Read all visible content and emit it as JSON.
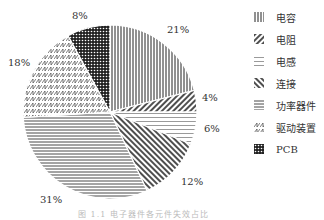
{
  "chart_data": {
    "type": "pie",
    "title": "",
    "start_angle": "12 o'clock, clockwise",
    "slices": [
      {
        "label": "电容",
        "value": 21,
        "pattern": "vertical-lines",
        "label_text": "21%"
      },
      {
        "label": "电阻",
        "value": 4,
        "pattern": "backslash-lines",
        "label_text": "4%"
      },
      {
        "label": "电感",
        "value": 6,
        "pattern": "waves",
        "label_text": "6%"
      },
      {
        "label": "连接",
        "value": 12,
        "pattern": "forward-slash-lines",
        "label_text": "12%"
      },
      {
        "label": "功率器件",
        "value": 31,
        "pattern": "horizontal-lines",
        "label_text": "31%"
      },
      {
        "label": "驱动装置",
        "value": 18,
        "pattern": "zigzag",
        "label_text": "18%"
      },
      {
        "label": "PCB",
        "value": 8,
        "pattern": "checkered",
        "label_text": "8%"
      }
    ],
    "legend_position": "right"
  },
  "caption": "图 1.1  电子器件各元件失效占比"
}
